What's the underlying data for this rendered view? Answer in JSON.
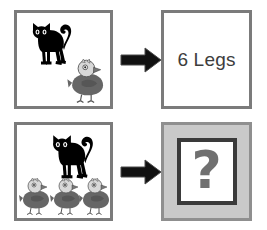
{
  "diagram": {
    "colors": {
      "panel_border": "#7b7b7b",
      "panel_background": "#ffffff",
      "unknown_panel_fill": "#c9c9c9",
      "unknown_inner_border": "#3a3a3a",
      "arrow": "#111111",
      "cat_body": "#000000",
      "bird_body": "#666666",
      "bird_head": "#d8d8d8",
      "text": "#3d3d3d",
      "question_mark": "#707070"
    },
    "rows": [
      {
        "id": "row-example",
        "scene": {
          "label": "scene-with-one-cat-and-one-bird",
          "cats": 1,
          "birds": 1
        },
        "arrow": {
          "icon": "arrow-right-icon",
          "label": "implies"
        },
        "result": {
          "type": "answer",
          "text": "6 Legs"
        }
      },
      {
        "id": "row-question",
        "scene": {
          "label": "scene-with-one-cat-and-three-birds",
          "cats": 1,
          "birds": 3
        },
        "arrow": {
          "icon": "arrow-right-icon",
          "label": "implies"
        },
        "result": {
          "type": "unknown",
          "text": "?"
        }
      }
    ]
  }
}
